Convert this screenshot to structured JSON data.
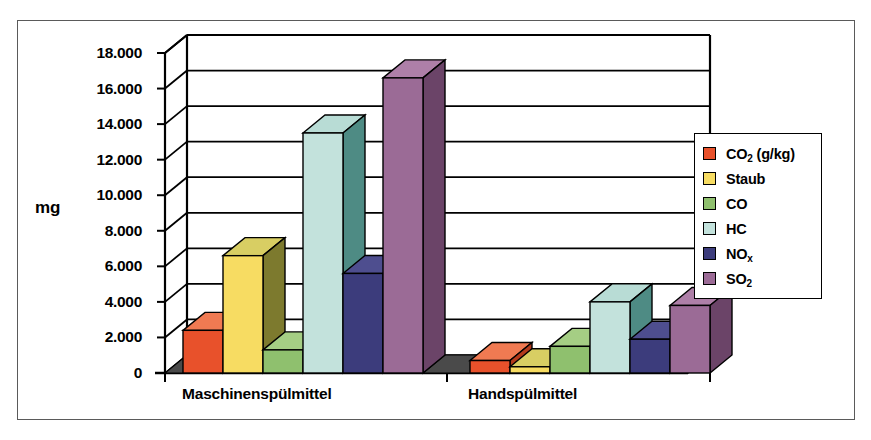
{
  "chart_data": {
    "type": "bar",
    "title": "",
    "subtitle": "",
    "xlabel": "",
    "ylabel": "mg",
    "categories": [
      "Maschinenspülmittel",
      "Handspülmittel"
    ],
    "ylim": [
      0,
      18000
    ],
    "ytick_step": 2000,
    "ytick_labels": [
      "0",
      "2.000",
      "4.000",
      "6.000",
      "8.000",
      "10.000",
      "12.000",
      "14.000",
      "16.000",
      "18.000"
    ],
    "ytick_values": [
      0,
      2000,
      4000,
      6000,
      8000,
      10000,
      12000,
      14000,
      16000,
      18000
    ],
    "grid": true,
    "grid_axis": "y",
    "legend_position": "right",
    "style": "3d-column",
    "series": [
      {
        "name": "CO₂ (g/kg)",
        "legend_label": "CO2 (g/kg)",
        "color": "#E8512B",
        "side_color": "#B33A1C",
        "top_color": "#F07A52",
        "values": [
          2400,
          700
        ]
      },
      {
        "name": "Staub",
        "legend_label": "Staub",
        "color": "#F7DC62",
        "side_color": "#7D7A2E",
        "top_color": "#D8CE63",
        "values": [
          6600,
          350
        ]
      },
      {
        "name": "CO",
        "legend_label": "CO",
        "color": "#8FC06E",
        "side_color": "#3F6B38",
        "top_color": "#A5CE84",
        "values": [
          1300,
          1500
        ]
      },
      {
        "name": "HC",
        "legend_label": "HC",
        "color": "#C3E2DC",
        "side_color": "#4E8B84",
        "top_color": "#B8DCD5",
        "values": [
          13500,
          4000
        ]
      },
      {
        "name": "NOₓ",
        "legend_label": "NOx",
        "color": "#3C3C7C",
        "side_color": "#23234F",
        "top_color": "#4E4E8F",
        "values": [
          5600,
          1900
        ]
      },
      {
        "name": "SO₂",
        "legend_label": "SO2",
        "color": "#9B6B96",
        "side_color": "#6B4468",
        "top_color": "#AE7FA8",
        "values": [
          16600,
          3800
        ]
      }
    ]
  },
  "axis": {
    "y_title": "mg"
  },
  "legend": {
    "items": [
      {
        "label": "CO",
        "sub": "2",
        "suffix": " (g/kg)",
        "color": "#E8512B"
      },
      {
        "label": "Staub",
        "sub": "",
        "suffix": "",
        "color": "#F7DC62"
      },
      {
        "label": "CO",
        "sub": "",
        "suffix": "",
        "color": "#8FC06E"
      },
      {
        "label": "HC",
        "sub": "",
        "suffix": "",
        "color": "#C3E2DC"
      },
      {
        "label": "NO",
        "sub": "x",
        "suffix": "",
        "color": "#3C3C7C"
      },
      {
        "label": "SO",
        "sub": "2",
        "suffix": "",
        "color": "#9B6B96"
      }
    ]
  },
  "colors": {
    "frame_border": "#5a5a5a",
    "axis": "#000000",
    "gridline": "#000000",
    "background": "#ffffff",
    "floor": "#4a4a4a"
  }
}
